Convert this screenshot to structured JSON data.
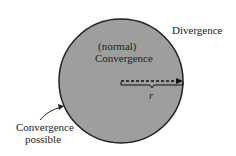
{
  "diagram": {
    "labels": {
      "divergence": "Divergence",
      "normal": "(normal)",
      "convergence": "Convergence",
      "radius": "r",
      "boundary_line1": "Convergence",
      "boundary_line2": "possible"
    },
    "colors": {
      "disk_fill": "#9e9e9e",
      "stroke": "#222222"
    }
  }
}
